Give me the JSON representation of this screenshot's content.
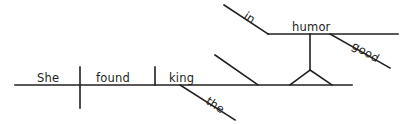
{
  "diagram": {
    "kind": "reed-kellogg-sentence-diagram",
    "sentence": "She found the king in good humor.",
    "ink_color": "#231f20",
    "background_color": "#ffffff",
    "words": {
      "subject": "She",
      "verb": "found",
      "object": "king",
      "object_article": "the",
      "preposition": "in",
      "prep_object": "humor",
      "prep_modifier": "good"
    },
    "labels": [
      {
        "id": "she",
        "text": "She",
        "x": 37,
        "y": 82,
        "rotate": 0
      },
      {
        "id": "found",
        "text": "found",
        "x": 96,
        "y": 82,
        "rotate": 0
      },
      {
        "id": "king",
        "text": "king",
        "x": 169,
        "y": 82,
        "rotate": 0
      },
      {
        "id": "the",
        "text": "the",
        "x": 205,
        "y": 103,
        "rotate": 33
      },
      {
        "id": "in",
        "text": "in",
        "x": 243,
        "y": 18,
        "rotate": 33
      },
      {
        "id": "humor",
        "text": "humor",
        "x": 292,
        "y": 31,
        "rotate": 0
      },
      {
        "id": "good",
        "text": "good",
        "x": 351,
        "y": 48,
        "rotate": 30
      }
    ],
    "lines": [
      {
        "id": "main-baseline",
        "x1": 15,
        "y1": 85,
        "x2": 352,
        "y2": 85
      },
      {
        "id": "subject-verb-divider",
        "x1": 80,
        "y1": 67,
        "x2": 80,
        "y2": 108
      },
      {
        "id": "verb-object-divider",
        "x1": 155,
        "y1": 67,
        "x2": 155,
        "y2": 85
      },
      {
        "id": "article-the-slant",
        "x1": 180,
        "y1": 85,
        "x2": 235,
        "y2": 120
      },
      {
        "id": "prep-phrase-slant",
        "x1": 215,
        "y1": 55,
        "x2": 258,
        "y2": 85
      },
      {
        "id": "triangle-left-leg",
        "x1": 290,
        "y1": 85,
        "x2": 310,
        "y2": 70
      },
      {
        "id": "triangle-right-leg",
        "x1": 310,
        "y1": 70,
        "x2": 332,
        "y2": 85
      },
      {
        "id": "triangle-riser",
        "x1": 310,
        "y1": 70,
        "x2": 310,
        "y2": 34
      },
      {
        "id": "preposition-slant",
        "x1": 224,
        "y1": 5,
        "x2": 268,
        "y2": 34
      },
      {
        "id": "prep-object-baseline",
        "x1": 268,
        "y1": 34,
        "x2": 398,
        "y2": 34
      },
      {
        "id": "modifier-good-slant",
        "x1": 330,
        "y1": 34,
        "x2": 390,
        "y2": 68
      }
    ]
  }
}
